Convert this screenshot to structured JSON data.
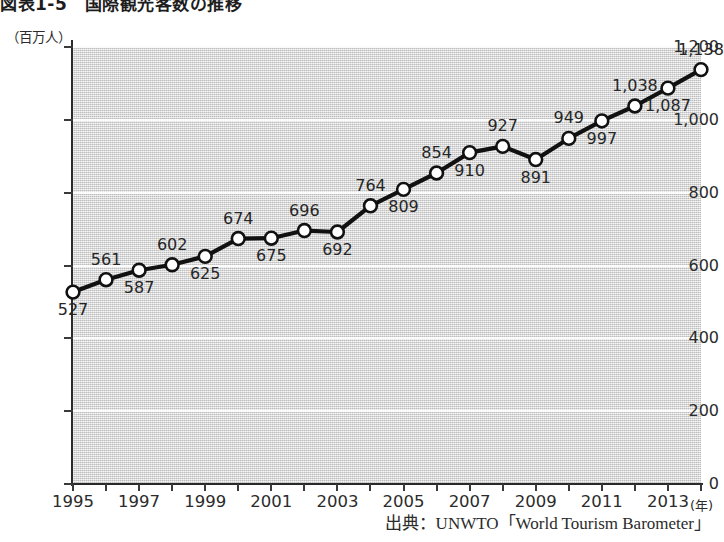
{
  "figure": {
    "title": "図表1-5　国際観光客数の推移",
    "y_unit_label": "（百万人）",
    "x_unit_label": "(年)",
    "source_note": "出典：UNWTO「World Tourism Barometer」"
  },
  "colors": {
    "plot_background": "#d7d7d7",
    "gridline": "#fbfbfb",
    "axis": "#2a2a2a",
    "line": "#111111",
    "marker_fill": "#ffffff",
    "marker_stroke": "#111111",
    "text": "#2b2b2b"
  },
  "chart_data": {
    "type": "line",
    "title": "図表1-5　国際観光客数の推移",
    "subtitle": "",
    "xlabel": "(年)",
    "ylabel": "（百万人）",
    "xlim": [
      1995,
      2014
    ],
    "ylim": [
      0,
      1200
    ],
    "grid": true,
    "legend_position": "none",
    "y_ticks": [
      0,
      200,
      400,
      600,
      800,
      1000,
      1200
    ],
    "y_tick_labels": [
      "0",
      "200",
      "400",
      "600",
      "800",
      "1,000",
      "1,200"
    ],
    "x_ticks": [
      1995,
      1997,
      1999,
      2001,
      2003,
      2005,
      2007,
      2009,
      2011,
      2013
    ],
    "x_tick_labels": [
      "1995",
      "1997",
      "1999",
      "2001",
      "2003",
      "2005",
      "2007",
      "2009",
      "2011",
      "2013"
    ],
    "x": [
      1995,
      1996,
      1997,
      1998,
      1999,
      2000,
      2001,
      2002,
      2003,
      2004,
      2005,
      2006,
      2007,
      2008,
      2009,
      2010,
      2011,
      2012,
      2013,
      2014
    ],
    "values": [
      527,
      561,
      587,
      602,
      625,
      674,
      675,
      696,
      692,
      764,
      809,
      854,
      910,
      927,
      891,
      949,
      997,
      1038,
      1087,
      1138
    ],
    "data_labels": [
      "527",
      "561",
      "587",
      "602",
      "625",
      "674",
      "675",
      "696",
      "692",
      "764",
      "809",
      "854",
      "910",
      "927",
      "891",
      "949",
      "997",
      "1,038",
      "1,087",
      "1,138"
    ],
    "label_positions": [
      "below",
      "above",
      "below",
      "above",
      "below",
      "above",
      "below",
      "above",
      "below",
      "above",
      "below",
      "above",
      "below",
      "above",
      "below",
      "above",
      "below",
      "above",
      "below",
      "above"
    ],
    "series": [
      {
        "name": "国際観光客数",
        "values": [
          527,
          561,
          587,
          602,
          625,
          674,
          675,
          696,
          692,
          764,
          809,
          854,
          910,
          927,
          891,
          949,
          997,
          1038,
          1087,
          1138
        ]
      }
    ]
  }
}
